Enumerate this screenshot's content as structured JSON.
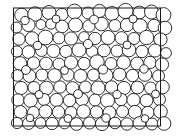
{
  "figure": {
    "type": "circle-packing-diagram",
    "background_color": "#ffffff",
    "stroke_color": "#1a1a1a",
    "fill_color": "#ffffff",
    "stroke_width": 0.9,
    "canvas": {
      "width": 179,
      "height": 139
    }
  },
  "frame": {
    "x": 13.5,
    "y": 8.0,
    "width": 147.0,
    "height": 118.0,
    "stroke_color": "#1a1a1a",
    "stroke_width": 1.0
  },
  "chart_data": {
    "type": "scatter",
    "title": "",
    "subtitle": "",
    "xlabel": "",
    "ylabel": "",
    "grid": false,
    "legend": "none",
    "xlim": [
      13.5,
      160.5
    ],
    "ylim": [
      8.0,
      126.0
    ],
    "marker": "open-circle",
    "point_count": 96,
    "radius_min": 3.4,
    "radius_max": 12.6,
    "circles": [
      {
        "cx": 21.5,
        "cy": 15.0,
        "r": 6.8
      },
      {
        "cx": 35.0,
        "cy": 14.0,
        "r": 7.2
      },
      {
        "cx": 49.0,
        "cy": 12.5,
        "r": 7.0
      },
      {
        "cx": 62.0,
        "cy": 14.5,
        "r": 6.2
      },
      {
        "cx": 74.5,
        "cy": 11.5,
        "r": 7.4
      },
      {
        "cx": 88.0,
        "cy": 13.0,
        "r": 6.0
      },
      {
        "cx": 99.5,
        "cy": 11.0,
        "r": 6.6
      },
      {
        "cx": 112.0,
        "cy": 13.5,
        "r": 7.0
      },
      {
        "cx": 125.5,
        "cy": 11.0,
        "r": 7.6
      },
      {
        "cx": 139.5,
        "cy": 12.5,
        "r": 6.4
      },
      {
        "cx": 151.5,
        "cy": 12.0,
        "r": 7.0
      },
      {
        "cx": 163.5,
        "cy": 15.0,
        "r": 7.4
      },
      {
        "cx": 16.5,
        "cy": 27.5,
        "r": 5.4
      },
      {
        "cx": 28.5,
        "cy": 25.0,
        "r": 6.6
      },
      {
        "cx": 41.0,
        "cy": 24.5,
        "r": 5.0
      },
      {
        "cx": 51.0,
        "cy": 24.0,
        "r": 5.2
      },
      {
        "cx": 62.0,
        "cy": 26.5,
        "r": 6.4
      },
      {
        "cx": 75.5,
        "cy": 25.0,
        "r": 7.0
      },
      {
        "cx": 89.0,
        "cy": 26.0,
        "r": 6.2
      },
      {
        "cx": 101.5,
        "cy": 24.0,
        "r": 6.8
      },
      {
        "cx": 115.0,
        "cy": 25.5,
        "r": 6.0
      },
      {
        "cx": 127.0,
        "cy": 25.0,
        "r": 6.6
      },
      {
        "cx": 140.0,
        "cy": 26.0,
        "r": 7.2
      },
      {
        "cx": 154.0,
        "cy": 25.5,
        "r": 6.2
      },
      {
        "cx": 165.0,
        "cy": 28.0,
        "r": 6.8
      },
      {
        "cx": 19.0,
        "cy": 39.0,
        "r": 6.2
      },
      {
        "cx": 32.0,
        "cy": 38.5,
        "r": 6.8
      },
      {
        "cx": 45.5,
        "cy": 37.5,
        "r": 7.4
      },
      {
        "cx": 59.0,
        "cy": 38.0,
        "r": 6.0
      },
      {
        "cx": 71.0,
        "cy": 38.5,
        "r": 6.6
      },
      {
        "cx": 84.0,
        "cy": 37.0,
        "r": 5.4
      },
      {
        "cx": 95.0,
        "cy": 38.5,
        "r": 6.2
      },
      {
        "cx": 108.0,
        "cy": 37.5,
        "r": 7.0
      },
      {
        "cx": 121.5,
        "cy": 38.0,
        "r": 6.4
      },
      {
        "cx": 134.0,
        "cy": 38.5,
        "r": 6.0
      },
      {
        "cx": 146.5,
        "cy": 37.5,
        "r": 7.2
      },
      {
        "cx": 160.5,
        "cy": 39.5,
        "r": 6.6
      },
      {
        "cx": 17.0,
        "cy": 51.5,
        "r": 5.6
      },
      {
        "cx": 28.5,
        "cy": 52.0,
        "r": 6.4
      },
      {
        "cx": 41.5,
        "cy": 50.5,
        "r": 6.0
      },
      {
        "cx": 53.5,
        "cy": 51.0,
        "r": 6.6
      },
      {
        "cx": 66.0,
        "cy": 51.5,
        "r": 6.2
      },
      {
        "cx": 79.0,
        "cy": 50.0,
        "r": 7.0
      },
      {
        "cx": 92.0,
        "cy": 51.5,
        "r": 5.8
      },
      {
        "cx": 104.0,
        "cy": 50.5,
        "r": 6.4
      },
      {
        "cx": 117.0,
        "cy": 51.0,
        "r": 6.0
      },
      {
        "cx": 129.0,
        "cy": 50.0,
        "r": 6.8
      },
      {
        "cx": 142.0,
        "cy": 51.5,
        "r": 6.2
      },
      {
        "cx": 155.0,
        "cy": 50.5,
        "r": 6.6
      },
      {
        "cx": 166.0,
        "cy": 53.0,
        "r": 5.4
      },
      {
        "cx": 20.0,
        "cy": 63.5,
        "r": 6.8
      },
      {
        "cx": 33.5,
        "cy": 63.0,
        "r": 6.2
      },
      {
        "cx": 46.0,
        "cy": 63.5,
        "r": 6.4
      },
      {
        "cx": 59.0,
        "cy": 64.0,
        "r": 6.0
      },
      {
        "cx": 71.0,
        "cy": 62.5,
        "r": 6.6
      },
      {
        "cx": 84.0,
        "cy": 63.5,
        "r": 6.2
      },
      {
        "cx": 97.0,
        "cy": 62.0,
        "r": 7.2
      },
      {
        "cx": 111.0,
        "cy": 63.5,
        "r": 6.0
      },
      {
        "cx": 123.5,
        "cy": 62.5,
        "r": 6.8
      },
      {
        "cx": 137.0,
        "cy": 63.5,
        "r": 6.4
      },
      {
        "cx": 150.0,
        "cy": 62.5,
        "r": 6.2
      },
      {
        "cx": 162.0,
        "cy": 64.5,
        "r": 6.6
      },
      {
        "cx": 17.5,
        "cy": 75.5,
        "r": 5.8
      },
      {
        "cx": 29.5,
        "cy": 76.0,
        "r": 6.4
      },
      {
        "cx": 42.0,
        "cy": 75.0,
        "r": 6.0
      },
      {
        "cx": 54.5,
        "cy": 75.5,
        "r": 6.8
      },
      {
        "cx": 68.0,
        "cy": 75.0,
        "r": 6.2
      },
      {
        "cx": 80.5,
        "cy": 76.0,
        "r": 6.6
      },
      {
        "cx": 93.5,
        "cy": 75.0,
        "r": 6.0
      },
      {
        "cx": 106.0,
        "cy": 75.5,
        "r": 7.0
      },
      {
        "cx": 119.5,
        "cy": 74.5,
        "r": 6.4
      },
      {
        "cx": 132.5,
        "cy": 75.5,
        "r": 6.2
      },
      {
        "cx": 145.0,
        "cy": 74.5,
        "r": 6.8
      },
      {
        "cx": 158.5,
        "cy": 76.0,
        "r": 6.0
      },
      {
        "cx": 21.0,
        "cy": 88.0,
        "r": 6.6
      },
      {
        "cx": 34.0,
        "cy": 87.5,
        "r": 6.0
      },
      {
        "cx": 46.5,
        "cy": 88.0,
        "r": 6.8
      },
      {
        "cx": 60.0,
        "cy": 87.0,
        "r": 6.2
      },
      {
        "cx": 72.5,
        "cy": 88.0,
        "r": 6.4
      },
      {
        "cx": 85.5,
        "cy": 87.0,
        "r": 6.0
      },
      {
        "cx": 98.0,
        "cy": 88.0,
        "r": 7.0
      },
      {
        "cx": 111.5,
        "cy": 87.0,
        "r": 6.2
      },
      {
        "cx": 124.0,
        "cy": 88.0,
        "r": 6.6
      },
      {
        "cx": 137.5,
        "cy": 87.5,
        "r": 6.4
      },
      {
        "cx": 150.5,
        "cy": 88.0,
        "r": 6.0
      },
      {
        "cx": 162.5,
        "cy": 87.0,
        "r": 6.8
      },
      {
        "cx": 18.0,
        "cy": 100.0,
        "r": 6.2
      },
      {
        "cx": 30.5,
        "cy": 100.5,
        "r": 6.8
      },
      {
        "cx": 44.0,
        "cy": 99.5,
        "r": 6.0
      },
      {
        "cx": 56.5,
        "cy": 100.0,
        "r": 6.6
      },
      {
        "cx": 69.5,
        "cy": 100.5,
        "r": 6.2
      },
      {
        "cx": 82.0,
        "cy": 99.5,
        "r": 6.4
      },
      {
        "cx": 95.0,
        "cy": 100.0,
        "r": 6.0
      },
      {
        "cx": 107.5,
        "cy": 100.5,
        "r": 7.0
      },
      {
        "cx": 121.0,
        "cy": 99.5,
        "r": 6.2
      },
      {
        "cx": 133.5,
        "cy": 100.0,
        "r": 6.6
      },
      {
        "cx": 146.5,
        "cy": 100.5,
        "r": 6.4
      },
      {
        "cx": 159.5,
        "cy": 99.5,
        "r": 6.0
      },
      {
        "cx": 20.5,
        "cy": 112.0,
        "r": 6.4
      },
      {
        "cx": 33.5,
        "cy": 112.5,
        "r": 6.0
      },
      {
        "cx": 45.5,
        "cy": 111.5,
        "r": 6.6
      },
      {
        "cx": 58.5,
        "cy": 112.0,
        "r": 6.2
      },
      {
        "cx": 71.0,
        "cy": 112.5,
        "r": 6.0
      },
      {
        "cx": 83.5,
        "cy": 111.5,
        "r": 6.8
      },
      {
        "cx": 96.5,
        "cy": 112.0,
        "r": 6.2
      },
      {
        "cx": 109.5,
        "cy": 112.5,
        "r": 6.4
      },
      {
        "cx": 122.5,
        "cy": 111.5,
        "r": 6.0
      },
      {
        "cx": 135.0,
        "cy": 112.0,
        "r": 6.6
      },
      {
        "cx": 148.0,
        "cy": 112.5,
        "r": 6.2
      },
      {
        "cx": 160.5,
        "cy": 111.5,
        "r": 6.8
      },
      {
        "cx": 17.0,
        "cy": 123.0,
        "r": 5.6
      },
      {
        "cx": 28.5,
        "cy": 123.5,
        "r": 6.0
      },
      {
        "cx": 40.5,
        "cy": 123.0,
        "r": 5.4
      },
      {
        "cx": 52.0,
        "cy": 123.5,
        "r": 6.2
      },
      {
        "cx": 64.5,
        "cy": 123.0,
        "r": 5.8
      },
      {
        "cx": 76.5,
        "cy": 124.0,
        "r": 6.4
      },
      {
        "cx": 89.5,
        "cy": 123.0,
        "r": 6.0
      },
      {
        "cx": 102.0,
        "cy": 124.0,
        "r": 6.6
      },
      {
        "cx": 115.0,
        "cy": 123.0,
        "r": 5.8
      },
      {
        "cx": 127.0,
        "cy": 124.0,
        "r": 6.2
      },
      {
        "cx": 139.5,
        "cy": 123.0,
        "r": 6.4
      },
      {
        "cx": 152.0,
        "cy": 124.0,
        "r": 6.0
      },
      {
        "cx": 164.0,
        "cy": 123.5,
        "r": 6.8
      },
      {
        "cx": 25.0,
        "cy": 20.5,
        "r": 4.2
      },
      {
        "cx": 56.0,
        "cy": 19.0,
        "r": 4.0
      },
      {
        "cx": 94.0,
        "cy": 19.5,
        "r": 4.4
      },
      {
        "cx": 133.0,
        "cy": 19.0,
        "r": 4.0
      },
      {
        "cx": 37.5,
        "cy": 45.5,
        "r": 4.2
      },
      {
        "cx": 88.0,
        "cy": 44.0,
        "r": 4.6
      },
      {
        "cx": 127.0,
        "cy": 45.0,
        "r": 4.0
      },
      {
        "cx": 26.0,
        "cy": 70.0,
        "r": 4.4
      },
      {
        "cx": 64.5,
        "cy": 70.5,
        "r": 4.0
      },
      {
        "cx": 103.0,
        "cy": 69.5,
        "r": 4.6
      },
      {
        "cx": 144.0,
        "cy": 69.0,
        "r": 4.2
      },
      {
        "cx": 39.0,
        "cy": 94.5,
        "r": 4.0
      },
      {
        "cx": 78.0,
        "cy": 94.0,
        "r": 4.4
      },
      {
        "cx": 117.0,
        "cy": 94.5,
        "r": 4.2
      },
      {
        "cx": 155.5,
        "cy": 94.0,
        "r": 4.0
      },
      {
        "cx": 30.0,
        "cy": 118.0,
        "r": 3.8
      },
      {
        "cx": 68.0,
        "cy": 118.5,
        "r": 4.0
      },
      {
        "cx": 106.0,
        "cy": 118.0,
        "r": 4.2
      },
      {
        "cx": 145.0,
        "cy": 118.5,
        "r": 3.8
      }
    ]
  }
}
